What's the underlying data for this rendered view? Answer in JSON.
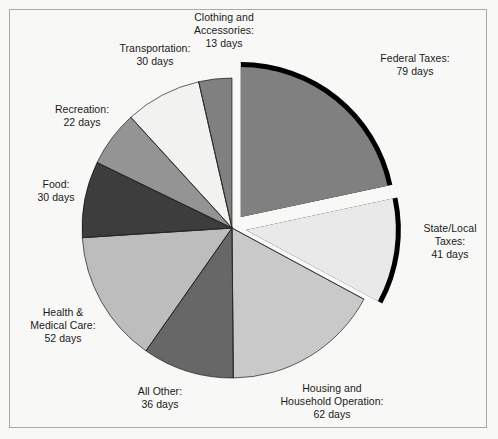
{
  "figure": {
    "background_color": "#f8f8f6",
    "border_color": "#a9a9a9",
    "text_color": "#1a1a1a",
    "separator_color": "#000000"
  },
  "chart_data": {
    "type": "pie",
    "title": "",
    "subtitle": "",
    "xlabel": "",
    "ylabel": "",
    "unit": "days",
    "total_days": 365,
    "legend_position": "outside-labels",
    "grid": false,
    "start_angle_deg": -90,
    "direction": "clockwise",
    "categories": [
      "Federal Taxes",
      "State/Local Taxes",
      "Housing and Household Operation",
      "All Other",
      "Health & Medical Care",
      "Food",
      "Recreation",
      "Transportation",
      "Clothing and Accessories"
    ],
    "values": [
      79,
      41,
      62,
      36,
      52,
      30,
      22,
      30,
      13
    ],
    "colors": [
      "#808080",
      "#e9e9e9",
      "#c9c9c9",
      "#676767",
      "#bdbdbd",
      "#3d3d3d",
      "#949494",
      "#f2f2f0",
      "#808080"
    ],
    "exploded": [
      true,
      true,
      false,
      false,
      false,
      false,
      false,
      false,
      false
    ],
    "slices": [
      {
        "label": "Federal Taxes",
        "value": 79,
        "value_text": "79 days",
        "label_text": "Federal Taxes:",
        "color": "#808080",
        "exploded": true
      },
      {
        "label": "State/Local Taxes",
        "value": 41,
        "value_text": "41 days",
        "label_text": "State/Local\nTaxes:",
        "color": "#e9e9e9",
        "exploded": true
      },
      {
        "label": "Housing and Household Operation",
        "value": 62,
        "value_text": "62 days",
        "label_text": "Housing and\nHousehold Operation:",
        "color": "#c9c9c9",
        "exploded": false
      },
      {
        "label": "All Other",
        "value": 36,
        "value_text": "36 days",
        "label_text": "All Other:",
        "color": "#676767",
        "exploded": false
      },
      {
        "label": "Health & Medical Care",
        "value": 52,
        "value_text": "52 days",
        "label_text": "Health &\nMedical Care:",
        "color": "#bdbdbd",
        "exploded": false
      },
      {
        "label": "Food",
        "value": 30,
        "value_text": "30 days",
        "label_text": "Food:",
        "color": "#3d3d3d",
        "exploded": false
      },
      {
        "label": "Recreation",
        "value": 22,
        "value_text": "22 days",
        "label_text": "Recreation:",
        "color": "#949494",
        "exploded": false
      },
      {
        "label": "Transportation",
        "value": 30,
        "value_text": "30 days",
        "label_text": "Transportation:",
        "color": "#f2f2f0",
        "exploded": false
      },
      {
        "label": "Clothing and Accessories",
        "value": 13,
        "value_text": "13 days",
        "label_text": "Clothing and\nAccessories:",
        "color": "#808080",
        "exploded": false
      }
    ],
    "geometry": {
      "cx": 232,
      "cy": 228,
      "r": 150,
      "explode_offset": 14
    },
    "label_positions": [
      {
        "key": "Federal Taxes",
        "x": 355,
        "y": 52,
        "w": 120
      },
      {
        "key": "State/Local Taxes",
        "x": 408,
        "y": 222,
        "w": 84
      },
      {
        "key": "Housing and Household Operation",
        "x": 258,
        "y": 382,
        "w": 148
      },
      {
        "key": "All Other",
        "x": 110,
        "y": 385,
        "w": 100
      },
      {
        "key": "Health & Medical Care",
        "x": 8,
        "y": 306,
        "w": 110
      },
      {
        "key": "Food",
        "x": 12,
        "y": 178,
        "w": 88
      },
      {
        "key": "Recreation",
        "x": 30,
        "y": 103,
        "w": 104
      },
      {
        "key": "Transportation",
        "x": 98,
        "y": 42,
        "w": 114
      },
      {
        "key": "Clothing and Accessories",
        "x": 172,
        "y": 11,
        "w": 104
      }
    ]
  }
}
